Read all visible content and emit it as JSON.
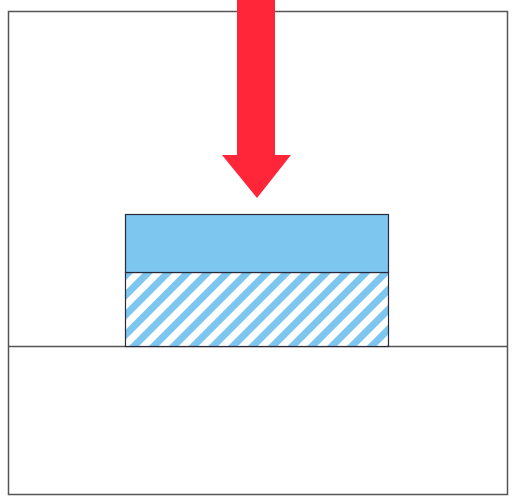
{
  "diagram": {
    "colors": {
      "background": "#ffffff",
      "frame_stroke": "#555555",
      "arrow": "#ff2639",
      "block_fill": "#7cc6f0",
      "hatch_stripe": "#7cc6f0",
      "hatch_gap": "#ffffff",
      "block_stroke": "#2a2a3a"
    },
    "elements": {
      "frame": {
        "label": "Container frame",
        "x": 8,
        "y": 11,
        "width": 499,
        "height": 483
      },
      "ground_line": {
        "label": "Base surface",
        "y": 346
      },
      "arrow": {
        "label": "Applied force (downward)",
        "shaft": {
          "x": 237,
          "y": 0,
          "width": 38,
          "height": 156
        },
        "head": {
          "left": 222,
          "right": 291,
          "top": 155,
          "tip_x": 257,
          "tip_y": 198
        }
      },
      "top_layer": {
        "label": "Solid top layer",
        "x": 125,
        "y": 214,
        "width": 263,
        "height": 58
      },
      "bottom_layer": {
        "label": "Hatched bottom layer",
        "x": 125,
        "y": 272,
        "width": 263,
        "height": 74,
        "hatch_angle_deg": 45,
        "hatch_period_px": 14
      }
    }
  }
}
